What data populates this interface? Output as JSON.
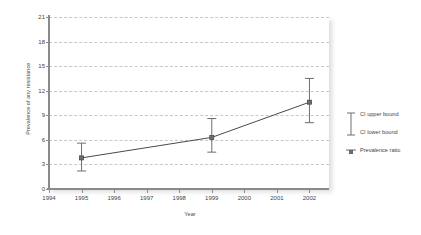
{
  "chart_data": {
    "type": "line",
    "title": "",
    "xlabel": "Year",
    "ylabel": "Prevalence of any resistance",
    "xlim": [
      1994,
      2002.6
    ],
    "ylim": [
      0,
      21
    ],
    "grid": true,
    "legend_position": "right",
    "x_ticks": [
      "1994",
      "1995",
      "1996",
      "1997",
      "1998",
      "1999",
      "2000",
      "2001",
      "2002"
    ],
    "y_ticks": [
      "0",
      "3",
      "6",
      "9",
      "12",
      "15",
      "18",
      "21"
    ],
    "x": [
      1995,
      1999,
      2002
    ],
    "values": [
      3.8,
      6.3,
      10.6
    ],
    "ci_lower": [
      2.2,
      4.5,
      8.1
    ],
    "ci_upper": [
      5.6,
      8.6,
      13.5
    ],
    "series": [
      {
        "name": "Prevalence ratio",
        "points": [
          {
            "year": 1995,
            "value": 3.8,
            "ci_lower": 2.2,
            "ci_upper": 5.6
          },
          {
            "year": 1999,
            "value": 6.3,
            "ci_lower": 4.5,
            "ci_upper": 8.6
          },
          {
            "year": 2002,
            "value": 10.6,
            "ci_lower": 8.1,
            "ci_upper": 13.5
          }
        ]
      }
    ],
    "legend": [
      {
        "label": "CI upper bound",
        "glyph": "error-bar-upper-cap-icon"
      },
      {
        "label": "CI lower bound",
        "glyph": "error-bar-lower-cap-icon"
      },
      {
        "label": "Prevalence ratio",
        "glyph": "square-marker-icon"
      }
    ],
    "colors": {
      "line": "#4a4a4a",
      "marker": "#6e6e6e",
      "error_bar": "#6e6e6e",
      "grid": "#c4c9d0",
      "axis": "#8a8a8a",
      "text": "#3f3f3f",
      "background": "#ffffff"
    }
  }
}
